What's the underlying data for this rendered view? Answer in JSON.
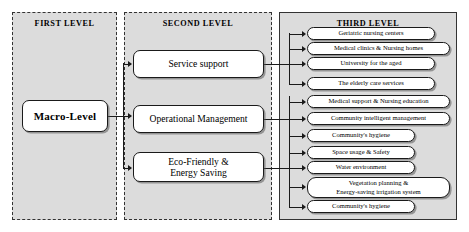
{
  "diagram": {
    "panels": [
      {
        "id": "first",
        "title": "FIRST LEVEL"
      },
      {
        "id": "second",
        "title": "SECOND LEVEL"
      },
      {
        "id": "third",
        "title": "THIRD LEVEL"
      }
    ],
    "first_level": {
      "node": "Macro-Level"
    },
    "second_level": {
      "nodes": [
        {
          "id": "service",
          "label": "Service support"
        },
        {
          "id": "operation",
          "label": "Operational Management"
        },
        {
          "id": "eco",
          "line1": "Eco-Friendly &",
          "line2": "Energy Saving"
        }
      ]
    },
    "third_level": {
      "items": [
        {
          "id": "geriatric-nursing-centers",
          "label": "Geriatric nursing centers",
          "parent": "service"
        },
        {
          "id": "medical-clinics",
          "label": "Medical clinics & Nursing homes",
          "parent": "service"
        },
        {
          "id": "university-for-the-aged",
          "label": "University for the aged",
          "parent": "service"
        },
        {
          "id": "elderly-care-services",
          "label": "The elderly care services",
          "parent": "service"
        },
        {
          "id": "medical-support",
          "label": "Medical support & Nursing education",
          "parent": "operation"
        },
        {
          "id": "community-intelligent-mgmt",
          "label": "Community intelligent management",
          "parent": "operation"
        },
        {
          "id": "community-hygiene-1",
          "label": "Community's hygiene",
          "parent": "operation"
        },
        {
          "id": "space-usage-safety",
          "label": "Space usage & Safety",
          "parent": "eco"
        },
        {
          "id": "water-environment",
          "label": "Water environment",
          "parent": "eco"
        },
        {
          "id": "vegetation-planning",
          "line1": "Vegetation planning &",
          "line2": "Energy-saving irrigation system",
          "parent": "eco"
        },
        {
          "id": "community-hygiene-2",
          "label": "Community's hygiene",
          "parent": "eco"
        }
      ]
    },
    "colors": {
      "panel_fill": "#dcdcdc",
      "node_fill": "#ffffff",
      "stroke": "#1a1a1a",
      "page_background": "#ffffff"
    }
  }
}
